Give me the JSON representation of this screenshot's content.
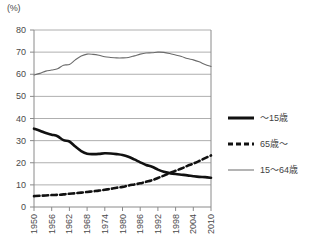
{
  "chart_data": {
    "type": "line",
    "title": "",
    "subtitle": "",
    "xlabel": "",
    "ylabel": "(%)",
    "unit_label": "(%)",
    "xlim": [
      1950,
      2010
    ],
    "ylim": [
      0,
      80
    ],
    "y_ticks": [
      0,
      10,
      20,
      30,
      40,
      50,
      60,
      70,
      80
    ],
    "y_tick_labels": [
      "0",
      "10",
      "20",
      "30",
      "40",
      "50",
      "60",
      "70",
      "80"
    ],
    "x_ticks": [
      1950,
      1956,
      1962,
      1968,
      1974,
      1980,
      1986,
      1992,
      1998,
      2004,
      2010
    ],
    "x_tick_labels": [
      "1950",
      "1956",
      "1962",
      "1968",
      "1974",
      "1980",
      "1986",
      "1992",
      "1998",
      "2004",
      "2010"
    ],
    "grid": "horizontal",
    "legend_position": "right",
    "series": [
      {
        "name": "〜15歳",
        "style": "solid-thick",
        "color": "#111111",
        "x": [
          1950,
          1952,
          1954,
          1956,
          1958,
          1960,
          1962,
          1964,
          1966,
          1968,
          1970,
          1972,
          1974,
          1976,
          1978,
          1980,
          1982,
          1984,
          1986,
          1988,
          1990,
          1992,
          1994,
          1996,
          1998,
          2000,
          2002,
          2004,
          2006,
          2008,
          2010
        ],
        "values": [
          35.4,
          34.5,
          33.4,
          32.7,
          32.0,
          30.2,
          29.6,
          27.3,
          25.3,
          24.1,
          23.9,
          24.0,
          24.3,
          24.2,
          23.9,
          23.5,
          22.7,
          21.5,
          20.2,
          19.0,
          18.2,
          16.9,
          15.9,
          15.3,
          14.9,
          14.6,
          14.3,
          13.9,
          13.6,
          13.5,
          13.2
        ]
      },
      {
        "name": "65歳〜",
        "style": "dashed",
        "color": "#111111",
        "x": [
          1950,
          1952,
          1954,
          1956,
          1958,
          1960,
          1962,
          1964,
          1966,
          1968,
          1970,
          1972,
          1974,
          1976,
          1978,
          1980,
          1982,
          1984,
          1986,
          1988,
          1990,
          1992,
          1994,
          1996,
          1998,
          2000,
          2002,
          2004,
          2006,
          2008,
          2010
        ],
        "values": [
          4.9,
          5.1,
          5.2,
          5.4,
          5.5,
          5.7,
          6.0,
          6.2,
          6.5,
          6.8,
          7.1,
          7.4,
          7.8,
          8.2,
          8.7,
          9.1,
          9.7,
          10.2,
          10.7,
          11.4,
          12.1,
          13.1,
          14.2,
          15.3,
          16.4,
          17.4,
          18.6,
          19.6,
          20.8,
          22.1,
          23.3
        ]
      },
      {
        "name": "15〜64歳",
        "style": "solid-thin",
        "color": "#6b6b6b",
        "x": [
          1950,
          1952,
          1954,
          1956,
          1958,
          1960,
          1962,
          1964,
          1966,
          1968,
          1970,
          1972,
          1974,
          1976,
          1978,
          1980,
          1982,
          1984,
          1986,
          1988,
          1990,
          1992,
          1994,
          1996,
          1998,
          2000,
          2002,
          2004,
          2006,
          2008,
          2010
        ],
        "values": [
          59.7,
          60.4,
          61.4,
          61.9,
          62.5,
          64.1,
          64.4,
          66.5,
          68.2,
          69.1,
          69.0,
          68.6,
          67.9,
          67.6,
          67.4,
          67.4,
          67.6,
          68.3,
          69.1,
          69.6,
          69.7,
          70.0,
          69.9,
          69.4,
          68.7,
          68.0,
          67.1,
          66.5,
          65.6,
          64.4,
          63.5
        ]
      }
    ]
  },
  "legend": {
    "items": [
      {
        "label": "〜15歳",
        "style": "solid-thick"
      },
      {
        "label": "65歳〜",
        "style": "dashed"
      },
      {
        "label": "15〜64歳",
        "style": "solid-thin"
      }
    ]
  }
}
